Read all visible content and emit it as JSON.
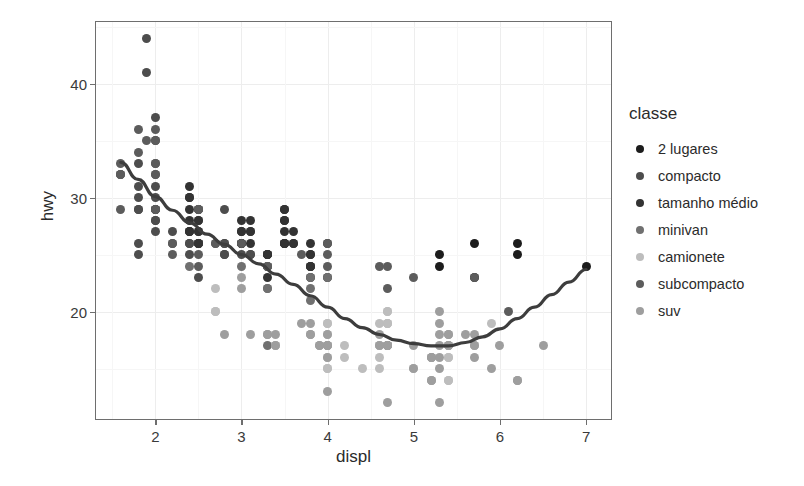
{
  "chart_data": {
    "type": "scatter",
    "title": "",
    "xlabel": "displ",
    "ylabel": "hwy",
    "xlim": [
      1.3,
      7.3
    ],
    "ylim": [
      10.5,
      45.5
    ],
    "xticks": [
      2,
      3,
      4,
      5,
      6,
      7
    ],
    "xtick_labels": [
      "2",
      "3",
      "4",
      "5",
      "6",
      "7"
    ],
    "yticks": [
      20,
      30,
      40
    ],
    "ytick_labels": [
      "20",
      "30",
      "40"
    ],
    "grid": true,
    "legend_position": "right",
    "legend_title": "classe",
    "series": [
      {
        "name": "2 lugares",
        "color": "#1c1c1c",
        "points": [
          [
            5.7,
            26
          ],
          [
            5.7,
            23
          ],
          [
            6.2,
            26
          ],
          [
            6.2,
            25
          ],
          [
            7.0,
            24
          ],
          [
            5.3,
            25
          ],
          [
            5.3,
            24
          ]
        ]
      },
      {
        "name": "compacto",
        "color": "#4d4d4d",
        "points": [
          [
            1.8,
            29
          ],
          [
            1.8,
            29
          ],
          [
            2.0,
            31
          ],
          [
            2.0,
            30
          ],
          [
            2.8,
            26
          ],
          [
            2.8,
            26
          ],
          [
            3.1,
            27
          ],
          [
            1.8,
            26
          ],
          [
            1.8,
            25
          ],
          [
            2.0,
            28
          ],
          [
            2.0,
            27
          ],
          [
            2.8,
            25
          ],
          [
            2.8,
            25
          ],
          [
            3.1,
            25
          ],
          [
            3.1,
            25
          ],
          [
            2.4,
            27
          ],
          [
            2.4,
            25
          ],
          [
            2.5,
            26
          ],
          [
            2.5,
            23
          ],
          [
            3.3,
            24
          ],
          [
            2.0,
            29
          ],
          [
            2.0,
            29
          ],
          [
            2.0,
            28
          ],
          [
            2.0,
            29
          ],
          [
            2.5,
            26
          ],
          [
            2.5,
            26
          ],
          [
            2.5,
            26
          ],
          [
            2.5,
            26
          ],
          [
            2.5,
            27
          ],
          [
            2.5,
            28
          ],
          [
            2.2,
            26
          ],
          [
            2.2,
            27
          ],
          [
            2.4,
            26
          ],
          [
            2.4,
            26
          ],
          [
            3.0,
            26
          ],
          [
            3.0,
            25
          ],
          [
            3.3,
            25
          ],
          [
            1.8,
            31
          ],
          [
            1.8,
            30
          ],
          [
            1.8,
            33
          ],
          [
            2.0,
            35
          ],
          [
            2.0,
            37
          ],
          [
            2.8,
            29
          ],
          [
            1.9,
            44
          ],
          [
            1.9,
            41
          ]
        ]
      },
      {
        "name": "tamanho médio",
        "color": "#333333",
        "points": [
          [
            3.1,
            27
          ],
          [
            3.8,
            26
          ],
          [
            3.8,
            25
          ],
          [
            3.8,
            24
          ],
          [
            4.0,
            26
          ],
          [
            3.5,
            29
          ],
          [
            3.5,
            29
          ],
          [
            3.5,
            28
          ],
          [
            3.5,
            27
          ],
          [
            3.0,
            28
          ],
          [
            3.0,
            27
          ],
          [
            3.5,
            26
          ],
          [
            3.5,
            26
          ],
          [
            3.6,
            26
          ],
          [
            2.4,
            31
          ],
          [
            2.4,
            30
          ],
          [
            3.1,
            26
          ],
          [
            3.5,
            26
          ],
          [
            3.6,
            27
          ],
          [
            2.4,
            27
          ],
          [
            3.0,
            26
          ],
          [
            3.3,
            25
          ],
          [
            3.3,
            25
          ],
          [
            3.3,
            24
          ],
          [
            3.3,
            23
          ],
          [
            3.8,
            25
          ],
          [
            3.8,
            24
          ],
          [
            2.5,
            29
          ],
          [
            2.5,
            28
          ],
          [
            3.0,
            27
          ],
          [
            3.0,
            26
          ],
          [
            3.5,
            26
          ],
          [
            2.4,
            30
          ],
          [
            2.4,
            29
          ],
          [
            3.1,
            28
          ],
          [
            3.5,
            28
          ],
          [
            3.6,
            26
          ],
          [
            2.4,
            28
          ],
          [
            2.4,
            27
          ],
          [
            2.5,
            27
          ],
          [
            2.5,
            26
          ],
          [
            3.3,
            25
          ],
          [
            3.8,
            23
          ],
          [
            3.8,
            24
          ],
          [
            4.0,
            23
          ]
        ]
      },
      {
        "name": "minivan",
        "color": "#707070",
        "points": [
          [
            2.4,
            24
          ],
          [
            3.0,
            24
          ],
          [
            3.3,
            22
          ],
          [
            3.3,
            22
          ],
          [
            3.3,
            24
          ],
          [
            3.3,
            24
          ],
          [
            3.3,
            17
          ],
          [
            3.8,
            22
          ],
          [
            3.8,
            21
          ],
          [
            4.0,
            23
          ],
          [
            3.8,
            23
          ]
        ]
      },
      {
        "name": "camionete",
        "color": "#bdbdbd",
        "points": [
          [
            2.7,
            20
          ],
          [
            2.7,
            20
          ],
          [
            2.7,
            22
          ],
          [
            3.4,
            17
          ],
          [
            3.4,
            17
          ],
          [
            4.0,
            18
          ],
          [
            4.0,
            17
          ],
          [
            4.0,
            19
          ],
          [
            4.0,
            19
          ],
          [
            4.7,
            19
          ],
          [
            4.7,
            19
          ],
          [
            4.7,
            19
          ],
          [
            4.7,
            20
          ],
          [
            4.7,
            20
          ],
          [
            5.7,
            17
          ],
          [
            5.7,
            17
          ],
          [
            5.9,
            19
          ],
          [
            4.6,
            19
          ],
          [
            5.4,
            17
          ],
          [
            5.4,
            17
          ],
          [
            4.0,
            16
          ],
          [
            4.2,
            16
          ],
          [
            4.6,
            17
          ],
          [
            4.6,
            17
          ],
          [
            4.6,
            17
          ],
          [
            5.4,
            16
          ],
          [
            5.4,
            16
          ],
          [
            4.0,
            15
          ],
          [
            4.0,
            15
          ],
          [
            4.6,
            16
          ],
          [
            5.0,
            15
          ],
          [
            4.2,
            17
          ],
          [
            4.4,
            15
          ],
          [
            4.6,
            15
          ],
          [
            5.4,
            14
          ],
          [
            5.4,
            14
          ]
        ]
      },
      {
        "name": "subcompacto",
        "color": "#5c5c5c",
        "points": [
          [
            1.6,
            33
          ],
          [
            1.6,
            32
          ],
          [
            1.6,
            32
          ],
          [
            1.6,
            29
          ],
          [
            1.6,
            32
          ],
          [
            1.8,
            34
          ],
          [
            1.8,
            36
          ],
          [
            2.0,
            36
          ],
          [
            2.5,
            29
          ],
          [
            2.5,
            29
          ],
          [
            3.3,
            24
          ],
          [
            2.0,
            33
          ],
          [
            2.0,
            33
          ],
          [
            2.0,
            32
          ],
          [
            2.0,
            32
          ],
          [
            2.7,
            26
          ],
          [
            2.7,
            26
          ],
          [
            3.0,
            26
          ],
          [
            3.7,
            25
          ],
          [
            4.0,
            24
          ],
          [
            4.7,
            24
          ],
          [
            4.7,
            22
          ],
          [
            5.7,
            23
          ],
          [
            6.1,
            20
          ],
          [
            4.0,
            26
          ],
          [
            4.0,
            25
          ],
          [
            4.6,
            24
          ],
          [
            5.0,
            23
          ],
          [
            2.2,
            26
          ],
          [
            2.2,
            25
          ],
          [
            2.5,
            24
          ],
          [
            2.5,
            25
          ],
          [
            1.9,
            35
          ],
          [
            2.0,
            35
          ],
          [
            2.0,
            29
          ],
          [
            2.5,
            29
          ]
        ]
      },
      {
        "name": "suv",
        "color": "#9e9e9e",
        "points": [
          [
            3.0,
            22
          ],
          [
            3.0,
            23
          ],
          [
            3.7,
            19
          ],
          [
            4.0,
            18
          ],
          [
            4.7,
            17
          ],
          [
            4.7,
            17
          ],
          [
            4.7,
            17
          ],
          [
            5.2,
            16
          ],
          [
            5.2,
            16
          ],
          [
            3.9,
            17
          ],
          [
            3.9,
            17
          ],
          [
            4.7,
            17
          ],
          [
            4.7,
            17
          ],
          [
            4.7,
            17
          ],
          [
            5.2,
            16
          ],
          [
            5.7,
            16
          ],
          [
            5.9,
            15
          ],
          [
            4.6,
            18
          ],
          [
            5.4,
            17
          ],
          [
            5.4,
            17
          ],
          [
            4.0,
            17
          ],
          [
            4.0,
            17
          ],
          [
            4.6,
            17
          ],
          [
            5.0,
            15
          ],
          [
            3.3,
            18
          ],
          [
            3.3,
            18
          ],
          [
            4.0,
            17
          ],
          [
            5.6,
            18
          ],
          [
            3.1,
            18
          ],
          [
            3.8,
            18
          ],
          [
            3.8,
            18
          ],
          [
            3.8,
            19
          ],
          [
            5.3,
            20
          ],
          [
            5.3,
            19
          ],
          [
            5.3,
            18
          ],
          [
            5.3,
            17
          ],
          [
            5.7,
            18
          ],
          [
            6.0,
            17
          ],
          [
            5.0,
            17
          ],
          [
            5.3,
            16
          ],
          [
            5.3,
            15
          ],
          [
            5.7,
            17
          ],
          [
            6.5,
            17
          ],
          [
            5.2,
            14
          ],
          [
            5.2,
            14
          ],
          [
            6.2,
            14
          ],
          [
            6.2,
            14
          ],
          [
            5.3,
            12
          ],
          [
            4.0,
            13
          ],
          [
            4.7,
            12
          ],
          [
            2.8,
            18
          ],
          [
            3.4,
            18
          ],
          [
            3.4,
            17
          ],
          [
            4.0,
            16
          ],
          [
            5.4,
            18
          ],
          [
            5.4,
            18
          ]
        ]
      }
    ],
    "smooth": {
      "name": "loess",
      "color": "#3d3d3d",
      "points": [
        [
          1.6,
          33.1
        ],
        [
          1.8,
          31.6
        ],
        [
          2.0,
          30.1
        ],
        [
          2.2,
          28.9
        ],
        [
          2.4,
          27.8
        ],
        [
          2.6,
          26.8
        ],
        [
          2.8,
          25.9
        ],
        [
          3.0,
          25.0
        ],
        [
          3.2,
          24.2
        ],
        [
          3.4,
          23.3
        ],
        [
          3.6,
          22.4
        ],
        [
          3.8,
          21.4
        ],
        [
          4.0,
          20.4
        ],
        [
          4.2,
          19.4
        ],
        [
          4.4,
          18.6
        ],
        [
          4.6,
          18.0
        ],
        [
          4.8,
          17.5
        ],
        [
          5.0,
          17.2
        ],
        [
          5.2,
          17.0
        ],
        [
          5.4,
          17.0
        ],
        [
          5.6,
          17.3
        ],
        [
          5.8,
          17.8
        ],
        [
          6.0,
          18.5
        ],
        [
          6.2,
          19.4
        ],
        [
          6.4,
          20.4
        ],
        [
          6.6,
          21.5
        ],
        [
          6.8,
          22.6
        ],
        [
          7.0,
          23.7
        ]
      ]
    }
  },
  "axis": {
    "xlabel": "displ",
    "ylabel": "hwy"
  },
  "legend": {
    "title": "classe",
    "items": [
      {
        "label": "2 lugares",
        "color": "#1c1c1c"
      },
      {
        "label": "compacto",
        "color": "#4d4d4d"
      },
      {
        "label": "tamanho médio",
        "color": "#333333"
      },
      {
        "label": "minivan",
        "color": "#707070"
      },
      {
        "label": "camionete",
        "color": "#bdbdbd"
      },
      {
        "label": "subcompacto",
        "color": "#5c5c5c"
      },
      {
        "label": "suv",
        "color": "#9e9e9e"
      }
    ]
  }
}
